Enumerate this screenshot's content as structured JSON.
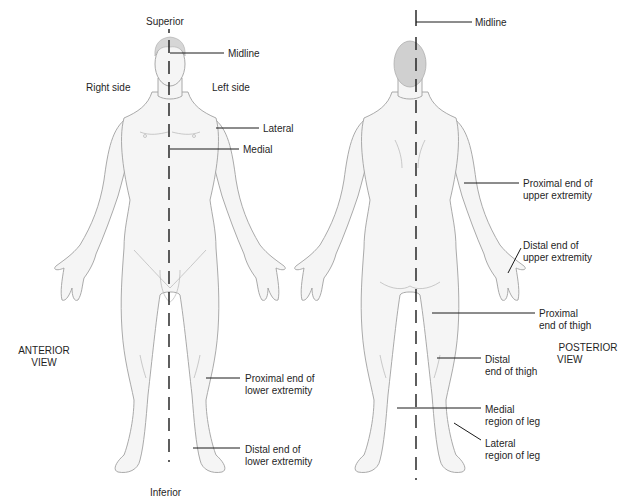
{
  "figure": {
    "anterior": {
      "view_label_1": "ANTERIOR",
      "view_label_2": "VIEW",
      "superior": "Superior",
      "inferior": "Inferior",
      "midline": "Midline",
      "right_side": "Right side",
      "left_side": "Left side",
      "lateral": "Lateral",
      "medial": "Medial",
      "proximal_lower_1": "Proximal end of",
      "proximal_lower_2": "lower extremity",
      "distal_lower_1": "Distal end of",
      "distal_lower_2": "lower extremity"
    },
    "posterior": {
      "view_label_1": "POSTERIOR",
      "view_label_2": "VIEW",
      "midline": "Midline",
      "proximal_upper_1": "Proximal end of",
      "proximal_upper_2": "upper extremity",
      "distal_upper_1": "Distal end of",
      "distal_upper_2": "upper extremity",
      "proximal_thigh_1": "Proximal",
      "proximal_thigh_2": "end of thigh",
      "distal_thigh_1": "Distal",
      "distal_thigh_2": "end of thigh",
      "medial_leg_1": "Medial",
      "medial_leg_2": "region of leg",
      "lateral_leg_1": "Lateral",
      "lateral_leg_2": "region of leg"
    },
    "colors": {
      "outline": "#9a9a9a",
      "skin": "#f4f4f4",
      "shade": "#e4e4e4",
      "hair": "#cfcfcf",
      "leader": "#1a1a1a"
    }
  }
}
